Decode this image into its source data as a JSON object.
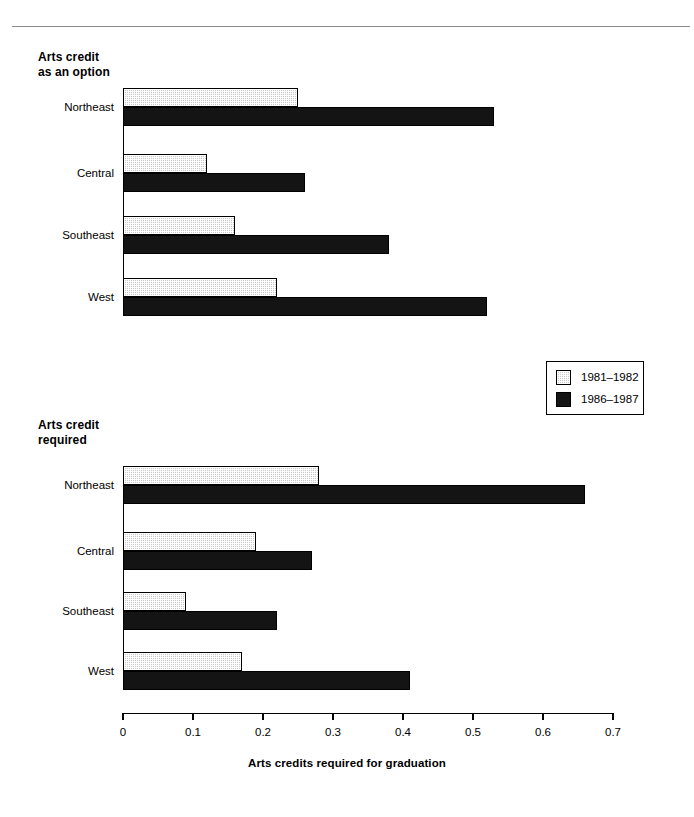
{
  "page": {
    "width": 694,
    "height": 817,
    "background": "#ffffff"
  },
  "legend": {
    "items": [
      {
        "label": "1981–1982",
        "swatch": "light-stipple",
        "color": "#c9c9c9"
      },
      {
        "label": "1986–1987",
        "swatch": "solid-black",
        "color": "#141414"
      }
    ]
  },
  "axis": {
    "title": "Arts credits required for graduation",
    "ticks": [
      "0",
      "0.1",
      "0.2",
      "0.3",
      "0.4",
      "0.5",
      "0.6",
      "0.7"
    ],
    "tick_values": [
      0,
      0.1,
      0.2,
      0.3,
      0.4,
      0.5,
      0.6,
      0.7
    ]
  },
  "panels": {
    "top": {
      "title": "Arts credit\nas an option"
    },
    "bottom": {
      "title": "Arts credit\nrequired"
    }
  },
  "chart_data": [
    {
      "type": "bar",
      "orientation": "horizontal",
      "title": "Arts credit as an option",
      "categories": [
        "Northeast",
        "Central",
        "Southeast",
        "West"
      ],
      "series": [
        {
          "name": "1981–1982",
          "values": [
            0.25,
            0.12,
            0.16,
            0.22
          ],
          "color": "#c9c9c9"
        },
        {
          "name": "1986–1987",
          "values": [
            0.53,
            0.26,
            0.38,
            0.52
          ],
          "color": "#141414"
        }
      ],
      "xlabel": "Arts credits required for graduation",
      "ylabel": "",
      "xlim": [
        0,
        0.7
      ],
      "grid": false,
      "legend_position": "middle-right"
    },
    {
      "type": "bar",
      "orientation": "horizontal",
      "title": "Arts credit required",
      "categories": [
        "Northeast",
        "Central",
        "Southeast",
        "West"
      ],
      "series": [
        {
          "name": "1981–1982",
          "values": [
            0.28,
            0.19,
            0.09,
            0.17
          ],
          "color": "#c9c9c9"
        },
        {
          "name": "1986–1987",
          "values": [
            0.66,
            0.27,
            0.22,
            0.41
          ],
          "color": "#141414"
        }
      ],
      "xlabel": "Arts credits required for graduation",
      "ylabel": "",
      "xlim": [
        0,
        0.7
      ],
      "grid": false,
      "legend_position": "middle-right"
    }
  ]
}
